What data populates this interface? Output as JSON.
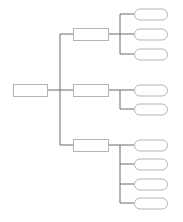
{
  "diagram": {
    "type": "tree",
    "colors": {
      "line": "#6b6b6b",
      "box_stroke": "#b4b4b4",
      "fill": "#ffffff"
    },
    "root": {
      "label": "",
      "x": 13,
      "y": 84,
      "w": 34,
      "h": 12
    },
    "trunk_x": 60,
    "branch_x": 120,
    "level1": [
      {
        "label": "",
        "cy": 34,
        "children": [
          {
            "label": "",
            "cy": 14
          },
          {
            "label": "",
            "cy": 34
          },
          {
            "label": "",
            "cy": 54
          }
        ]
      },
      {
        "label": "",
        "cy": 90,
        "children": [
          {
            "label": "",
            "cy": 90
          },
          {
            "label": "",
            "cy": 109
          }
        ]
      },
      {
        "label": "",
        "cy": 145,
        "children": [
          {
            "label": "",
            "cy": 145
          },
          {
            "label": "",
            "cy": 164
          },
          {
            "label": "",
            "cy": 184
          },
          {
            "label": "",
            "cy": 203
          }
        ]
      }
    ],
    "l1_box": {
      "x": 73,
      "w": 35,
      "h": 12
    },
    "leaf_box": {
      "x": 134,
      "w": 33,
      "h": 11,
      "r": 5.5
    }
  }
}
